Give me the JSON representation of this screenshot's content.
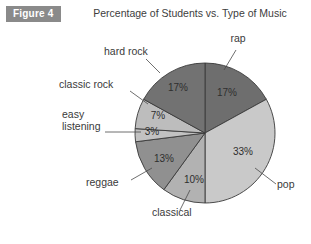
{
  "figure": {
    "badge_label": "Figure 4",
    "badge_bg": "#8a8a8a",
    "badge_text_color": "#ffffff"
  },
  "chart_data": {
    "type": "pie",
    "title": "Percentage of Students vs. Type of Music",
    "xlabel": "",
    "ylabel": "",
    "unit": "%",
    "start_angle_deg": 0,
    "direction": "clockwise",
    "legend": "none",
    "grid": false,
    "categories": [
      "rap",
      "pop",
      "classical",
      "reggae",
      "easy listening",
      "classic rock",
      "hard rock"
    ],
    "values": [
      17,
      33,
      10,
      13,
      3,
      7,
      17
    ],
    "value_labels": [
      "17%",
      "33%",
      "10%",
      "13%",
      "3%",
      "7%",
      "17%"
    ],
    "colors": [
      "#6e6e6e",
      "#c9c9c9",
      "#b2b2b2",
      "#909090",
      "#c2c2c2",
      "#bdbdbd",
      "#727272"
    ],
    "slices": [
      {
        "name": "rap",
        "value": 17,
        "label": "17%",
        "color": "#6e6e6e",
        "label_x": 227,
        "label_y": 93,
        "cat_x": 238,
        "cat_y": 42,
        "cat_anchor": "middle",
        "leader": "M 236 50 L 224 70"
      },
      {
        "name": "pop",
        "value": 33,
        "label": "33%",
        "color": "#c9c9c9",
        "label_x": 243,
        "label_y": 152,
        "cat_x": 277,
        "cat_y": 188,
        "cat_anchor": "start",
        "leader": "M 276 184 L 255 168"
      },
      {
        "name": "classical",
        "value": 10,
        "label": "10%",
        "color": "#b2b2b2",
        "label_x": 194,
        "label_y": 180,
        "cat_x": 152,
        "cat_y": 216,
        "cat_anchor": "start",
        "leader": "M 180 210 L 190 190"
      },
      {
        "name": "reggae",
        "value": 13,
        "label": "13%",
        "color": "#909090",
        "label_x": 164,
        "label_y": 159,
        "cat_x": 86,
        "cat_y": 186,
        "cat_anchor": "start",
        "leader": "M 131 180 L 152 168"
      },
      {
        "name": "easy listening",
        "value": 3,
        "label": "3%",
        "color": "#c2c2c2",
        "label_x": 152,
        "label_y": 132,
        "cat_x": 62,
        "cat_y": 118,
        "cat_anchor": "start",
        "leader": "M 105 132 L 141 132"
      },
      {
        "name": "classic rock",
        "value": 7,
        "label": "7%",
        "color": "#bdbdbd",
        "label_x": 158,
        "label_y": 116,
        "cat_x": 59,
        "cat_y": 88,
        "cat_anchor": "start",
        "leader": "M 130 91 L 148 104"
      },
      {
        "name": "hard rock",
        "value": 17,
        "label": "17%",
        "color": "#727272",
        "label_x": 178,
        "label_y": 88,
        "cat_x": 104,
        "cat_y": 55,
        "cat_anchor": "start",
        "leader": "M 146 59 L 160 73"
      }
    ],
    "geometry": {
      "center_x": 205,
      "center_y": 133,
      "radius": 70
    }
  }
}
